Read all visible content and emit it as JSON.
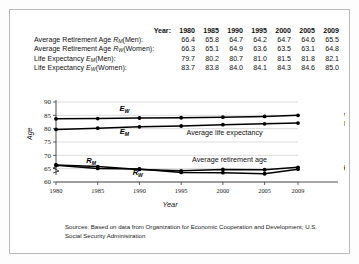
{
  "table": {
    "year_header": "Year:",
    "years": [
      "1980",
      "1985",
      "1990",
      "1995",
      "2000",
      "2005",
      "2009"
    ],
    "rows": [
      {
        "label_prefix": "Average Retirement Age ",
        "symbol": "R",
        "symbol_sub": "M",
        "label_suffix": "(Men):",
        "values": [
          "66.4",
          "65.8",
          "64.7",
          "64.2",
          "64.7",
          "64.6",
          "65.5"
        ]
      },
      {
        "label_prefix": "Average Retirement Age ",
        "symbol": "R",
        "symbol_sub": "W",
        "label_suffix": "(Women):",
        "values": [
          "66.3",
          "65.1",
          "64.9",
          "63.6",
          "63.5",
          "63.1",
          "64.8"
        ]
      },
      {
        "label_prefix": "Life Expectancy ",
        "symbol": "E",
        "symbol_sub": "M",
        "label_suffix": "(Men):",
        "values": [
          "79.7",
          "80.2",
          "80.7",
          "81.0",
          "81.5",
          "81.8",
          "82.1"
        ]
      },
      {
        "label_prefix": "Life Expectancy ",
        "symbol": "E",
        "symbol_sub": "W",
        "label_suffix": "(Women):",
        "values": [
          "83.7",
          "83.8",
          "84.0",
          "84.1",
          "84.3",
          "84.6",
          "85.0"
        ]
      }
    ]
  },
  "chart_data": {
    "type": "line",
    "title": "",
    "xlabel": "Year",
    "ylabel": "Age",
    "x": [
      1980,
      1985,
      1990,
      1995,
      2000,
      2005,
      2009
    ],
    "xtick_labels": [
      "1980",
      "1985",
      "1990",
      "1995",
      "2000",
      "2005",
      "2009"
    ],
    "ytick_labels": [
      "60",
      "65",
      "70",
      "75",
      "80",
      "85",
      "90"
    ],
    "yticks": [
      60,
      65,
      70,
      75,
      80,
      85,
      90
    ],
    "ylim": [
      60,
      90
    ],
    "xlim": [
      1980,
      2009
    ],
    "axis_break": true,
    "grid": true,
    "legend_position": "right",
    "series": [
      {
        "name": "Life Expectancy (Women)",
        "symbol": "E",
        "symbol_sub": "W",
        "side_label": "Women",
        "values": [
          83.7,
          83.8,
          84.0,
          84.1,
          84.3,
          84.6,
          85.0
        ]
      },
      {
        "name": "Life Expectancy (Men)",
        "symbol": "E",
        "symbol_sub": "M",
        "side_label": "Men",
        "values": [
          79.7,
          80.2,
          80.7,
          81.0,
          81.5,
          81.8,
          82.1
        ]
      },
      {
        "name": "Average Retirement Age (Men)",
        "symbol": "R",
        "symbol_sub": "M",
        "side_label": "Men",
        "values": [
          66.4,
          65.8,
          64.7,
          64.2,
          64.7,
          64.6,
          65.5
        ]
      },
      {
        "name": "Average Retirement Age (Women)",
        "symbol": "R",
        "symbol_sub": "W",
        "side_label": "Women",
        "values": [
          66.3,
          65.1,
          64.9,
          63.6,
          63.5,
          63.1,
          64.8
        ]
      }
    ],
    "annotations": [
      "Average life expectancy",
      "Average retirement age"
    ]
  },
  "source": {
    "line1": "Sources: Based on data from Organization for Economic Cooperation and Development; U.S.",
    "line2": "Social Security Administration"
  }
}
